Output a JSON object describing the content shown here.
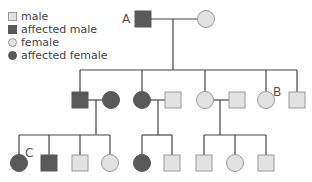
{
  "legend": [
    {
      "shape": "square",
      "fill": "#e2e2e2",
      "label": "male"
    },
    {
      "shape": "square",
      "fill": "#595959",
      "label": "affected male"
    },
    {
      "shape": "circle",
      "fill": "#e2e2e2",
      "label": "female"
    },
    {
      "shape": "circle",
      "fill": "#595959",
      "label": "affected female"
    }
  ],
  "colors": {
    "unaffected": "#e2e2e2",
    "affected": "#595959",
    "line": "#444444",
    "outline": "#9a9a9a"
  },
  "labels": {
    "A": "A",
    "B": "B",
    "C": "C"
  },
  "pedigree": {
    "generation1": [
      {
        "id": "A",
        "sex": "male",
        "affected": true,
        "x": 143,
        "y": 19
      },
      {
        "sex": "female",
        "affected": false,
        "x": 206,
        "y": 19
      }
    ],
    "generation2": [
      {
        "sex": "male",
        "affected": true,
        "x": 80,
        "y": 100
      },
      {
        "sex": "female",
        "affected": true,
        "x": 111,
        "y": 100
      },
      {
        "sex": "female",
        "affected": true,
        "x": 142,
        "y": 100
      },
      {
        "sex": "male",
        "affected": false,
        "x": 173,
        "y": 100
      },
      {
        "sex": "female",
        "affected": false,
        "x": 205,
        "y": 100
      },
      {
        "sex": "male",
        "affected": false,
        "x": 237,
        "y": 100
      },
      {
        "id": "B",
        "sex": "female",
        "affected": false,
        "x": 266,
        "y": 100
      },
      {
        "sex": "male",
        "affected": false,
        "x": 297,
        "y": 100
      }
    ],
    "generation3": [
      {
        "id": "C",
        "sex": "female",
        "affected": true,
        "x": 19,
        "y": 163
      },
      {
        "sex": "male",
        "affected": true,
        "x": 49,
        "y": 163
      },
      {
        "sex": "male",
        "affected": false,
        "x": 80,
        "y": 163
      },
      {
        "sex": "female",
        "affected": false,
        "x": 110,
        "y": 163
      },
      {
        "sex": "female",
        "affected": true,
        "x": 142,
        "y": 163
      },
      {
        "sex": "male",
        "affected": false,
        "x": 172,
        "y": 163
      },
      {
        "sex": "male",
        "affected": false,
        "x": 204,
        "y": 163
      },
      {
        "sex": "female",
        "affected": false,
        "x": 235,
        "y": 163
      },
      {
        "sex": "male",
        "affected": false,
        "x": 266,
        "y": 163
      }
    ]
  }
}
